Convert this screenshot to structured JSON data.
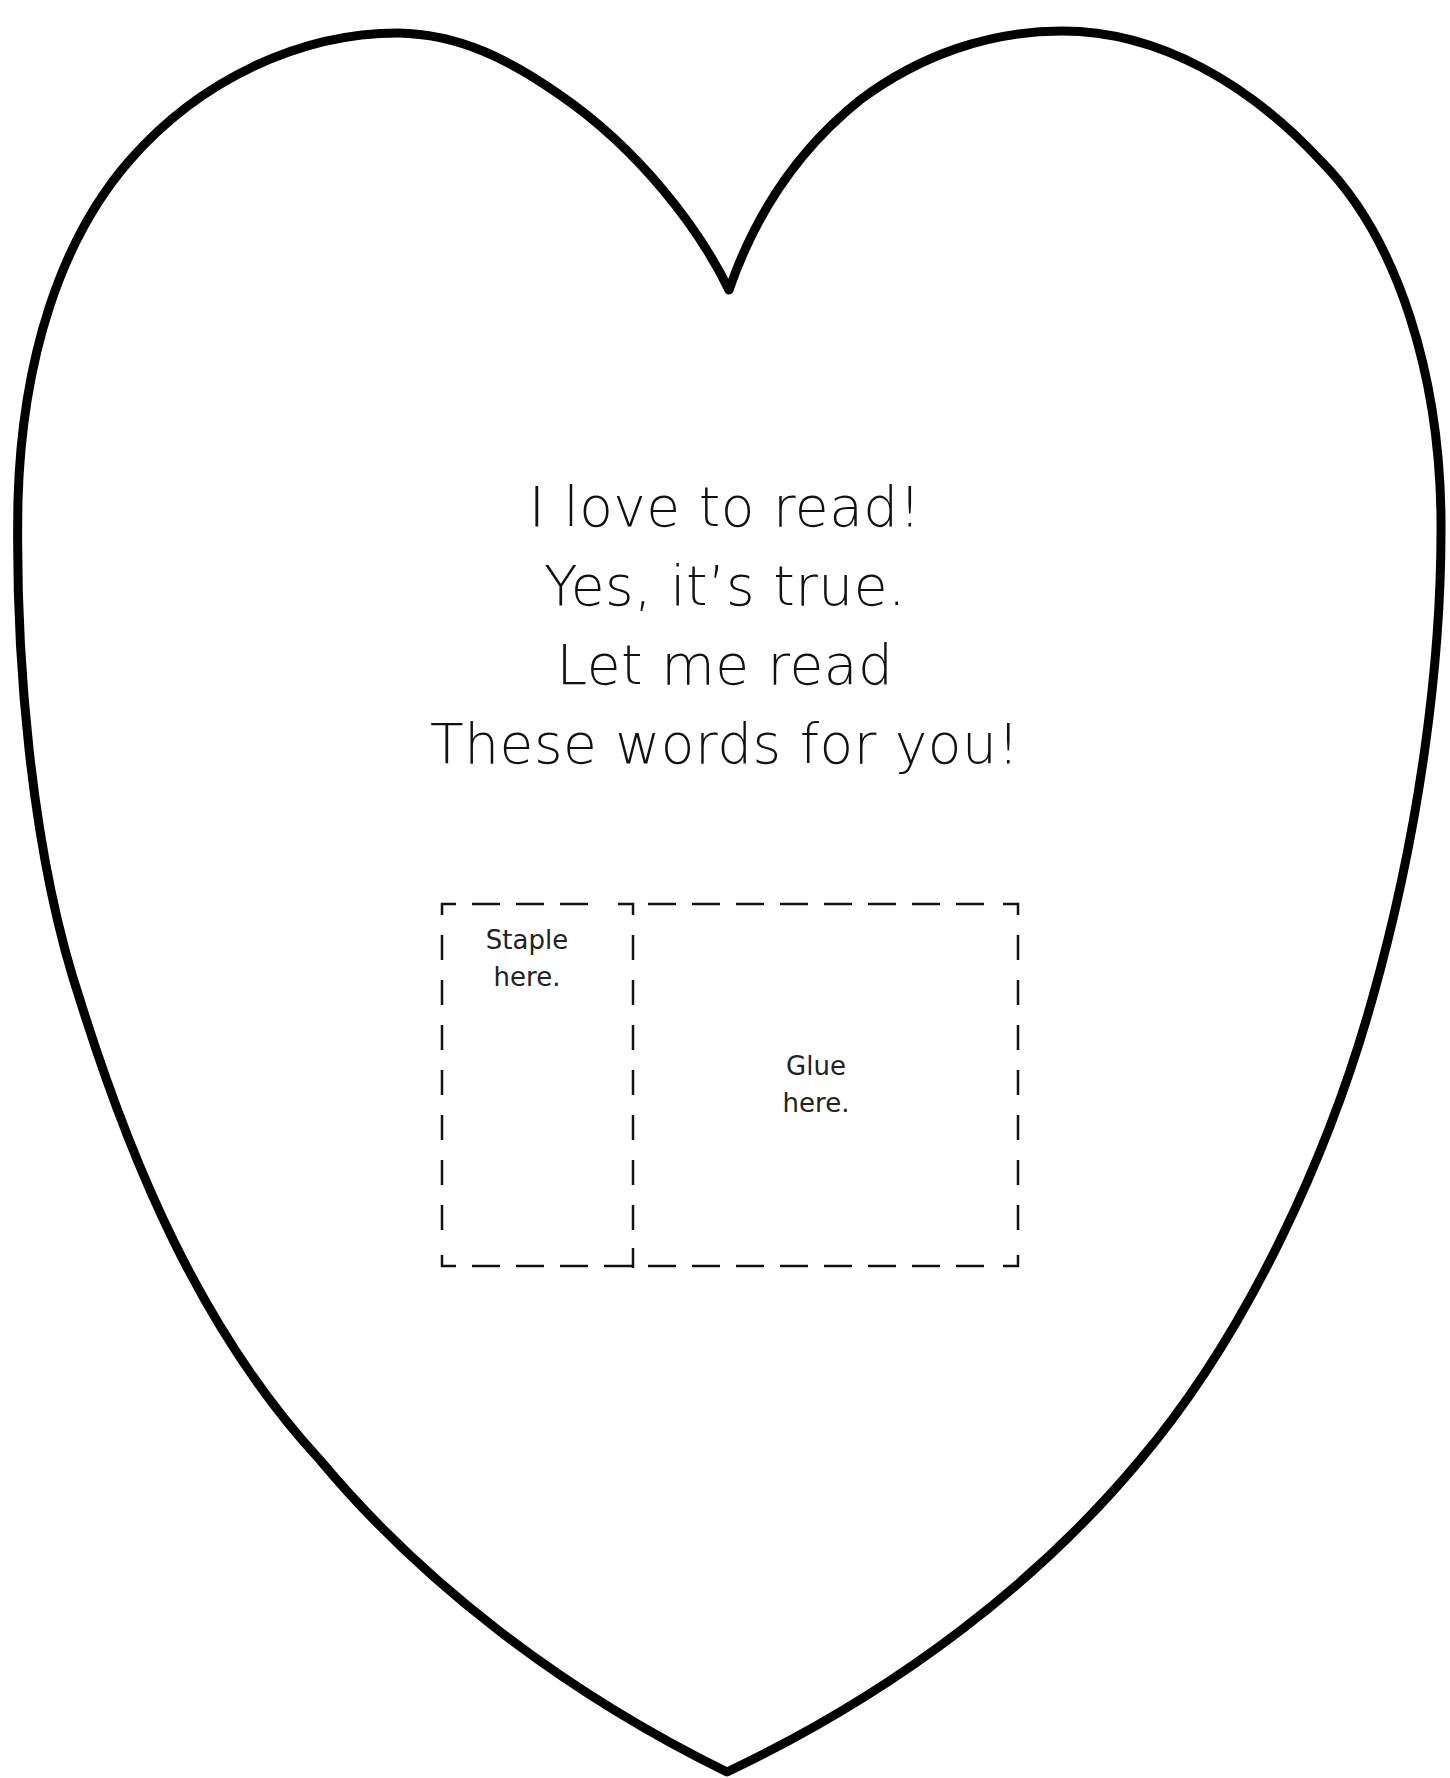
{
  "worksheet": {
    "poem": {
      "lines": [
        "I love to read!",
        "Yes, it’s true.",
        "Let me read",
        "These words for you!"
      ]
    },
    "staple_box": {
      "label_line1": "Staple",
      "label_line2": "here."
    },
    "glue_box": {
      "label_line1": "Glue",
      "label_line2": "here."
    },
    "colors": {
      "outline": "#000000",
      "background": "#ffffff",
      "text": "#111111"
    },
    "heart_shape": "heart-outline"
  }
}
